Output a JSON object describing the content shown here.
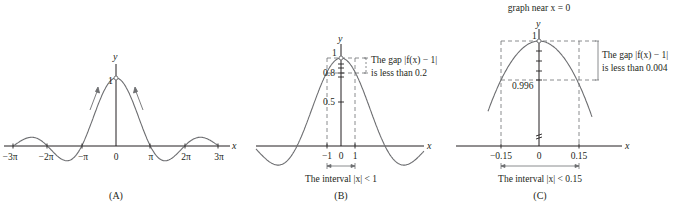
{
  "figure": {
    "panels": [
      {
        "id": "A",
        "label": "(A)",
        "y_axis_label": "y",
        "x_axis_label": "x",
        "peak_label": "1",
        "x_ticks": [
          "−3π",
          "−2π",
          "−π",
          "0",
          "π",
          "2π",
          "3π"
        ]
      },
      {
        "id": "B",
        "label": "(B)",
        "y_axis_label": "y",
        "x_axis_label": "x",
        "y_ticks": [
          "1",
          "0.8",
          "0.5"
        ],
        "x_ticks": [
          "−1",
          "0",
          "1"
        ],
        "gap_note_line1": "The gap |f(x) − 1|",
        "gap_note_line2": "is less than 0.2",
        "interval_note": "The interval |x| < 1"
      },
      {
        "id": "C",
        "label": "(C)",
        "title": "graph near x = 0",
        "y_axis_label": "y",
        "x_axis_label": "x",
        "y_ticks": [
          "1",
          "0.996"
        ],
        "x_ticks": [
          "−0.15",
          "0",
          "0.15"
        ],
        "gap_note_line1": "The gap |f(x) − 1|",
        "gap_note_line2": "is less than 0.004",
        "interval_note": "The interval |x| < 0.15"
      }
    ],
    "colors": {
      "curve": "#6d6e71",
      "axis": "#231f20",
      "dashed": "#6d6e71"
    }
  }
}
